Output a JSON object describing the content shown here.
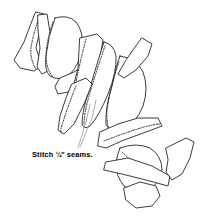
{
  "figure": {
    "type": "line-illustration",
    "background_color": "#ffffff",
    "line_color": "#1a1a1a",
    "stitch_color": "#2a2a2a",
    "leader_color": "#8a8a8a",
    "piece_count": 12
  },
  "caption": {
    "prefix": "Stitch ",
    "fraction": "¼″",
    "suffix": " seams.",
    "full_text": "Stitch ¼″ seams."
  }
}
